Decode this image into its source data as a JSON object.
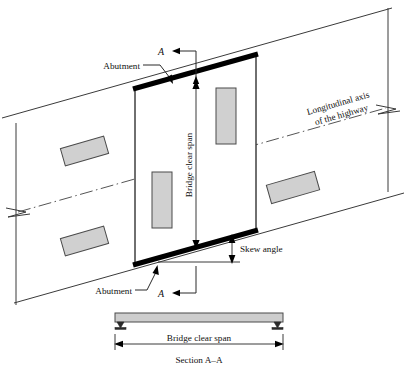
{
  "figure": {
    "labels": {
      "abutment_top": "Abutment",
      "abutment_bottom": "Abutment",
      "longitudinal_axis_line1": "Longitudinal axis",
      "longitudinal_axis_line2": "of the highway",
      "bridge_clear_span_plan": "Bridge clear span",
      "skew_angle": "Skew angle",
      "section_marker_top": "A",
      "section_marker_bottom": "A",
      "bridge_clear_span_section": "Bridge clear span",
      "section_caption": "Section A–A"
    },
    "colors": {
      "vehicle_fill": "#d0d0d0",
      "beam_fill": "#cdcdcd",
      "abutment": "#000000",
      "line": "#3a3a3a",
      "background": "#ffffff"
    }
  }
}
